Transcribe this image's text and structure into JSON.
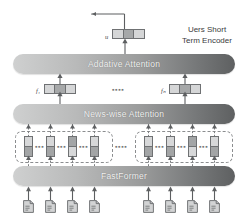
{
  "figure": {
    "title_label": "Uers Short Term Encoder",
    "title_line1": "Uers Short",
    "title_line2": "Term Encoder"
  },
  "layers": [
    {
      "id": "addative-attention",
      "label": "Addative Attention"
    },
    {
      "id": "news-wise-attention",
      "label": "News-wise Attention"
    },
    {
      "id": "fastformer",
      "label": "FastFormer"
    }
  ],
  "output": {
    "vector_label": "u",
    "cells": [
      "light",
      "dark",
      "light"
    ]
  },
  "news_vectors": [
    {
      "label": "f₁",
      "cells": [
        "light",
        "dark",
        "light"
      ]
    },
    {
      "label": "fₙ",
      "cells": [
        "light",
        "dark",
        "light"
      ]
    }
  ],
  "ellipsis": {
    "dots": "▪▪▪▪",
    "dots_small": "▪▪▪"
  },
  "token_groups": [
    {
      "id": "token-group-left",
      "tokens": [
        {
          "cells": [
            "light",
            "dark"
          ]
        },
        {
          "cells": [
            "light",
            "dark"
          ]
        },
        {
          "cells": [
            "dark",
            "light"
          ]
        },
        {
          "cells": [
            "light",
            "dark"
          ]
        }
      ]
    },
    {
      "id": "token-group-right",
      "tokens": [
        {
          "cells": [
            "light",
            "dark"
          ]
        },
        {
          "cells": [
            "light",
            "dark"
          ]
        },
        {
          "cells": [
            "dark",
            "light"
          ]
        },
        {
          "cells": [
            "light",
            "dark"
          ]
        }
      ]
    }
  ],
  "documents": [
    {
      "id": "doc-1"
    },
    {
      "id": "doc-2"
    },
    {
      "id": "doc-3"
    },
    {
      "id": "doc-4"
    },
    {
      "id": "doc-5"
    },
    {
      "id": "doc-6"
    },
    {
      "id": "doc-7"
    },
    {
      "id": "doc-8"
    }
  ],
  "colors": {
    "bar_gradient_start": "#cfd0d0",
    "bar_gradient_end": "#5e6061",
    "bar_text": "#f2f2f2",
    "stroke": "#6f7173",
    "cell_dark": "#a6a8a9",
    "cell_light": "#d5d6d7",
    "background": "#ffffff",
    "dashed_border": "#8b8d8f",
    "title_text": "#3a3b3d"
  }
}
